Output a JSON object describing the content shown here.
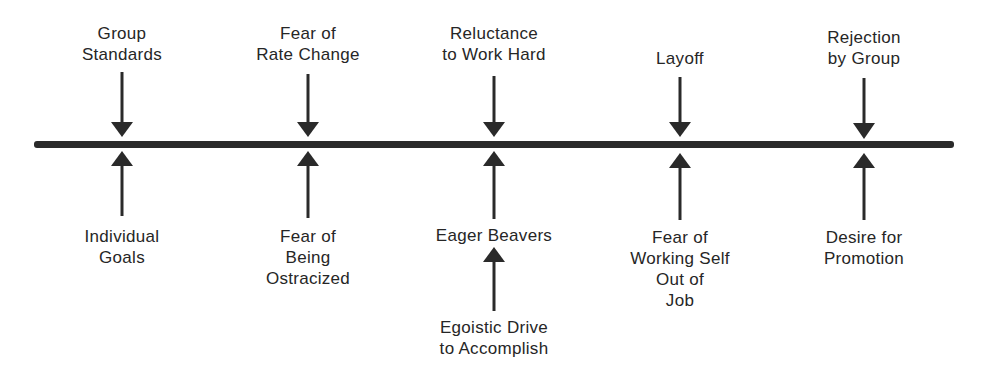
{
  "diagram": {
    "type": "force-field",
    "line_color": "#2a2a2a",
    "text_color": "#262626",
    "columns": [
      {
        "x": 122,
        "top_force": "Group\nStandards",
        "bottom_forces": [
          "Individual\nGoals"
        ]
      },
      {
        "x": 308,
        "top_force": "Fear of\nRate Change",
        "bottom_forces": [
          "Fear of\nBeing\nOstracized"
        ]
      },
      {
        "x": 494,
        "top_force": "Reluctance\nto Work Hard",
        "bottom_forces": [
          "Eager Beavers",
          "Egoistic Drive\nto Accomplish"
        ]
      },
      {
        "x": 680,
        "top_force": "Layoff",
        "bottom_forces": [
          "Fear of\nWorking Self\nOut of\nJob"
        ]
      },
      {
        "x": 864,
        "top_force": "Rejection\nby Group",
        "bottom_forces": [
          "Desire for\nPromotion"
        ]
      }
    ]
  }
}
